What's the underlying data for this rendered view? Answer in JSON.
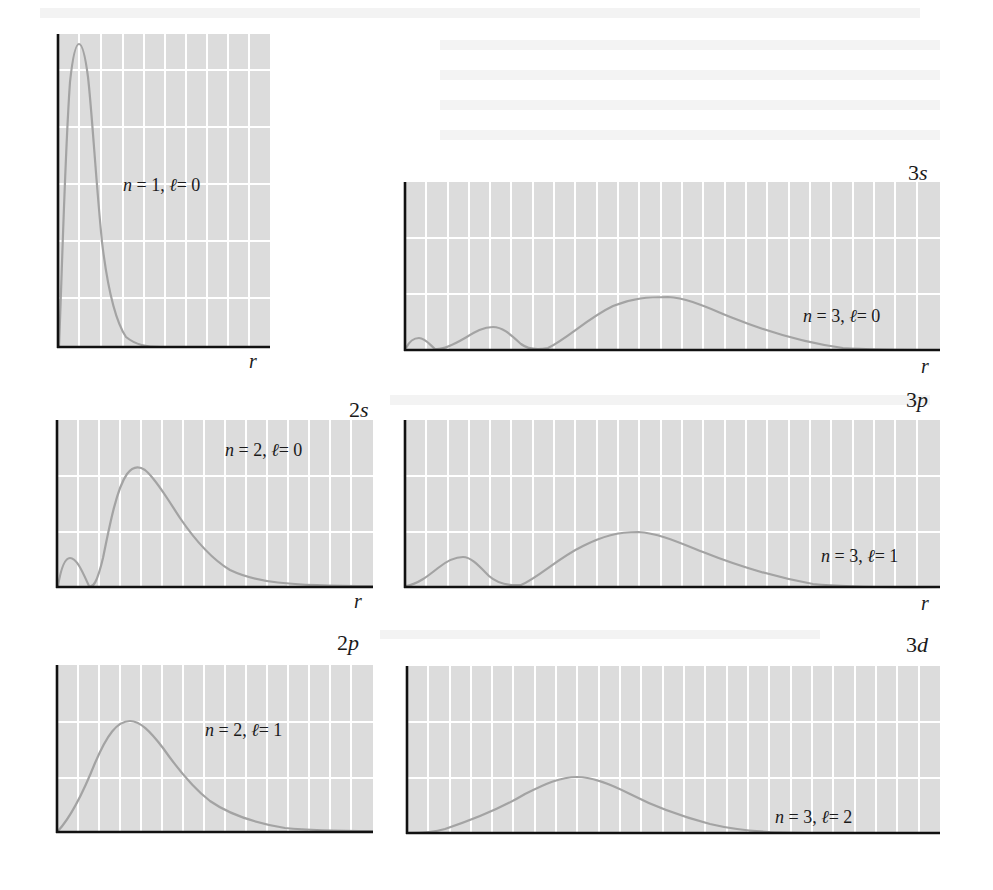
{
  "figure": {
    "style": {
      "plot_background": "#dcdcdc",
      "grid_color": "#ffffff",
      "curve_color": "#a3a3a3",
      "axis_color": "#111111",
      "text_color": "#1a1a1a"
    },
    "axis_label": "r",
    "panels": [
      {
        "id": "1s",
        "orbital": "",
        "n": "1",
        "l": "0",
        "n_text": "n = 1, ",
        "l_text": "ℓ= 0",
        "has_r_label": true
      },
      {
        "id": "2s",
        "orbital": "2s",
        "n": "2",
        "l": "0",
        "n_text": "n = 2, ",
        "l_text": "ℓ= 0",
        "has_r_label": true
      },
      {
        "id": "2p",
        "orbital": "2p",
        "n": "2",
        "l": "1",
        "n_text": "n = 2, ",
        "l_text": "ℓ= 1",
        "has_r_label": false
      },
      {
        "id": "3s",
        "orbital": "3s",
        "n": "3",
        "l": "0",
        "n_text": "n = 3, ",
        "l_text": "ℓ= 0",
        "has_r_label": true
      },
      {
        "id": "3p",
        "orbital": "3p",
        "n": "3",
        "l": "1",
        "n_text": "n = 3, ",
        "l_text": "ℓ= 1",
        "has_r_label": true
      },
      {
        "id": "3d",
        "orbital": "3d",
        "n": "3",
        "l": "2",
        "n_text": "n = 3, ",
        "l_text": "ℓ= 2",
        "has_r_label": false
      }
    ]
  },
  "chart_data": [
    {
      "type": "line",
      "title": "n = 1, ℓ = 0 (1s radial probability distribution)",
      "xlabel": "r",
      "ylabel": "",
      "grid": true,
      "x": [
        0,
        0.5,
        1,
        1.5,
        2,
        3,
        4,
        5,
        6,
        8,
        10
      ],
      "values": [
        0,
        0.74,
        1.0,
        0.84,
        0.56,
        0.18,
        0.05,
        0.01,
        0.003,
        0,
        0
      ],
      "annotations": [
        "single maximum near r ≈ 1 a0, no radial nodes"
      ]
    },
    {
      "type": "line",
      "title": "2s: n = 2, ℓ = 0",
      "xlabel": "r",
      "ylabel": "",
      "grid": true,
      "x": [
        0,
        0.76,
        2,
        3,
        5.24,
        7,
        10,
        14,
        20
      ],
      "values": [
        0,
        0.28,
        0,
        0.28,
        0.68,
        0.55,
        0.25,
        0.06,
        0
      ],
      "annotations": [
        "one radial node at r = 2 a0",
        "two maxima, outer larger"
      ]
    },
    {
      "type": "line",
      "title": "2p: n = 2, ℓ = 1",
      "xlabel": "r",
      "ylabel": "",
      "grid": true,
      "x": [
        0,
        2,
        4,
        6,
        8,
        10,
        14,
        20
      ],
      "values": [
        0,
        0.42,
        0.68,
        0.55,
        0.38,
        0.22,
        0.06,
        0
      ],
      "annotations": [
        "single maximum near r ≈ 4 a0, no radial nodes"
      ]
    },
    {
      "type": "line",
      "title": "3s: n = 3, ℓ = 0",
      "xlabel": "r",
      "ylabel": "",
      "grid": true,
      "x": [
        0,
        0.74,
        1.9,
        4.2,
        7.1,
        10,
        13.1,
        17,
        22,
        28
      ],
      "values": [
        0,
        0.1,
        0,
        0.24,
        0,
        0.3,
        0.52,
        0.42,
        0.16,
        0.02
      ],
      "annotations": [
        "two radial nodes",
        "three maxima, outermost largest"
      ]
    },
    {
      "type": "line",
      "title": "3p: n = 3, ℓ = 1",
      "xlabel": "r",
      "ylabel": "",
      "grid": true,
      "x": [
        0,
        3,
        6,
        9,
        12,
        15,
        20,
        26
      ],
      "values": [
        0,
        0.24,
        0,
        0.3,
        0.5,
        0.44,
        0.18,
        0.02
      ],
      "annotations": [
        "one radial node at r = 6 a0",
        "two maxima, outer larger"
      ]
    },
    {
      "type": "line",
      "title": "3d: n = 3, ℓ = 2",
      "xlabel": "r",
      "ylabel": "",
      "grid": true,
      "x": [
        0,
        3,
        6,
        9,
        12,
        15,
        20,
        26
      ],
      "values": [
        0,
        0.06,
        0.3,
        0.5,
        0.4,
        0.25,
        0.08,
        0.01
      ],
      "annotations": [
        "single maximum near r ≈ 9 a0, no radial nodes"
      ]
    }
  ]
}
